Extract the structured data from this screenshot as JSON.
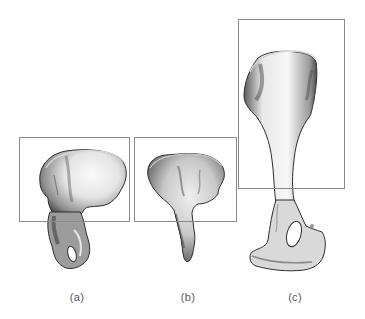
{
  "figure": {
    "panels": [
      {
        "id": "a",
        "label": "(a)",
        "subject": "ilium-bone-illustration",
        "box": {
          "x": 19,
          "y": 137,
          "width": 110,
          "height": 84
        },
        "label_center_x": 77
      },
      {
        "id": "b",
        "label": "(b)",
        "subject": "ilium-bone-illustration",
        "box": {
          "x": 134,
          "y": 137,
          "width": 102,
          "height": 84
        },
        "label_center_x": 188
      },
      {
        "id": "c",
        "label": "(c)",
        "subject": "ilium-bone-illustration",
        "box": {
          "x": 238,
          "y": 19,
          "width": 106,
          "height": 169
        },
        "label_center_x": 295
      }
    ],
    "colors": {
      "box_stroke": "#8a8a8a",
      "bone_light": "#f2f2f2",
      "bone_mid": "#b5b5b5",
      "bone_dark": "#3a3a3a",
      "label": "#555555"
    }
  }
}
